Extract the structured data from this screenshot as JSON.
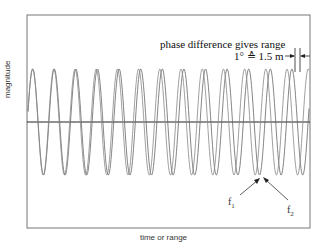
{
  "diagram": {
    "annotation_title": "phase difference gives range",
    "annotation_value": "1° ≙ 1.5 m",
    "y_axis_label": "magnitude",
    "x_axis_label": "time or range",
    "labels": [
      {
        "id": "f1",
        "base": "f",
        "sub": "1"
      },
      {
        "id": "f2",
        "base": "f",
        "sub": "2"
      }
    ],
    "colors": {
      "frame": "#555555",
      "wave": "#666666",
      "axis": "#222222",
      "text": "#111111"
    }
  }
}
